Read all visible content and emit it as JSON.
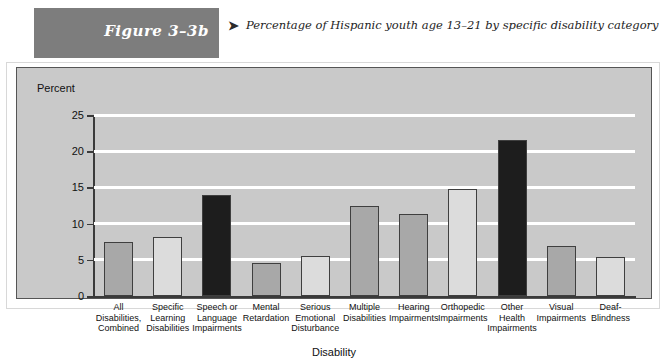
{
  "header": {
    "figure_label": "Figure 3–3b",
    "caption_arrow": "➤",
    "caption": "Percentage of Hispanic youth age 13–21 by specific disability category"
  },
  "colors": {
    "banner": "#7d7d7d",
    "panel_bg": "#c9c9c9",
    "gridline": "#ffffff",
    "bar_medium": "#a8a8a8",
    "bar_light": "#dcdcdc",
    "bar_dark": "#1d1d1d",
    "axis": "#3a3a3a"
  },
  "chart_data": {
    "type": "bar",
    "title": "Percentage of Hispanic youth age 13–21 by specific disability category",
    "xlabel": "Disability",
    "ylabel": "Percent",
    "ylim": [
      0,
      25
    ],
    "yticks": [
      0,
      5,
      10,
      15,
      20,
      25
    ],
    "grid": true,
    "legend": "none",
    "categories": [
      "All Disabilities, Combined",
      "Specific Learning Disabilities",
      "Speech or Language Impairments",
      "Mental Retardation",
      "Serious Emotional Disturbance",
      "Multiple Disabilities",
      "Hearing Impairments",
      "Orthopedic Impairments",
      "Other Health Impairments",
      "Visual Impairments",
      "Deaf-Blindness"
    ],
    "category_lines": [
      [
        "All",
        "Disabilities,",
        "Combined"
      ],
      [
        "Specific",
        "Learning",
        "Disabilities"
      ],
      [
        "Speech or",
        "Language",
        "Impairments"
      ],
      [
        "Mental",
        "Retardation"
      ],
      [
        "Serious",
        "Emotional",
        "Disturbance"
      ],
      [
        "Multiple",
        "Disabilities"
      ],
      [
        "Hearing",
        "Impairments"
      ],
      [
        "Orthopedic",
        "Impairments"
      ],
      [
        "Other",
        "Health",
        "Impairments"
      ],
      [
        "Visual",
        "Impairments"
      ],
      [
        "Deaf-",
        "Blindness"
      ]
    ],
    "values": [
      7.5,
      8.2,
      13.9,
      4.5,
      5.5,
      12.4,
      11.3,
      14.8,
      21.5,
      6.9,
      5.4
    ],
    "bar_shades": [
      "medium",
      "light",
      "dark",
      "medium",
      "light",
      "medium",
      "medium",
      "light",
      "dark",
      "medium",
      "light"
    ]
  }
}
